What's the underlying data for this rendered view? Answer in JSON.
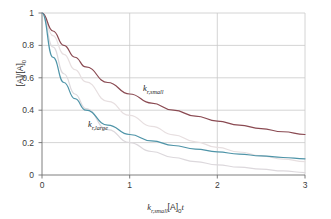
{
  "chart_data": {
    "type": "line",
    "title": "",
    "xlabel": "k_r,small [A]_0 t",
    "ylabel": "[A]/[A]_0",
    "xlim": [
      0,
      3
    ],
    "ylim": [
      0,
      1
    ],
    "xticks": [
      "0",
      "1",
      "2",
      "3"
    ],
    "yticks": [
      "0",
      "0.2",
      "0.4",
      "0.6",
      "0.8",
      "1"
    ],
    "grid": true,
    "legend_position": "inline-annotations",
    "series": [
      {
        "name": "k_r,small",
        "color": "#8a4a52",
        "annotation": "k_r,small",
        "x": [
          0,
          0.125,
          0.25,
          0.375,
          0.5,
          0.75,
          1,
          1.25,
          1.5,
          1.75,
          2,
          2.25,
          2.5,
          2.75,
          3
        ],
        "values": [
          1.0,
          0.889,
          0.8,
          0.727,
          0.667,
          0.571,
          0.5,
          0.444,
          0.4,
          0.364,
          0.333,
          0.308,
          0.286,
          0.267,
          0.25
        ]
      },
      {
        "name": "k_r,large",
        "color": "#4e94a8",
        "annotation": "k_r,large",
        "x": [
          0,
          0.125,
          0.25,
          0.375,
          0.5,
          0.75,
          1,
          1.25,
          1.5,
          1.75,
          2,
          2.25,
          2.5,
          2.75,
          3
        ],
        "values": [
          1.0,
          0.727,
          0.571,
          0.471,
          0.4,
          0.308,
          0.25,
          0.211,
          0.182,
          0.16,
          0.143,
          0.129,
          0.118,
          0.108,
          0.1
        ]
      },
      {
        "name": "first-order-reference",
        "color": "#dcd8dc",
        "annotation": "",
        "x": [
          0,
          0.125,
          0.25,
          0.375,
          0.5,
          0.75,
          1,
          1.25,
          1.5,
          1.75,
          2,
          2.25,
          2.5,
          2.75,
          3
        ],
        "values": [
          1.0,
          0.79,
          0.625,
          0.5,
          0.41,
          0.28,
          0.2,
          0.145,
          0.108,
          0.082,
          0.063,
          0.048,
          0.036,
          0.025,
          0.015
        ]
      },
      {
        "name": "second-reference",
        "color": "#e7dfe0",
        "annotation": "",
        "x": [
          0,
          0.125,
          0.25,
          0.375,
          0.5,
          0.75,
          1,
          1.25,
          1.5,
          1.75,
          2,
          2.25,
          2.5,
          2.75,
          3
        ],
        "values": [
          1.0,
          0.86,
          0.745,
          0.65,
          0.575,
          0.455,
          0.368,
          0.3,
          0.248,
          0.205,
          0.17,
          0.142,
          0.118,
          0.098,
          0.082
        ]
      }
    ]
  },
  "axes": {
    "y_label_main": "[A]/[A]",
    "y_label_sub": "0",
    "x_label_k": "k",
    "x_label_k_sub": "r,small",
    "x_label_conc": "[A]",
    "x_label_conc_sub": "0",
    "x_label_t": "t"
  },
  "annotations": {
    "small_k": "k",
    "small_sub": "r,small",
    "large_k": "k",
    "large_sub": "r,large"
  },
  "colors": {
    "curve_small": "#8a4a52",
    "curve_large": "#4e94a8",
    "curve_light": "#dcd8dc",
    "curve_light2": "#e7dfe0",
    "grid": "#c9c9c9",
    "axis": "#6f6f6f",
    "text": "#333333"
  }
}
